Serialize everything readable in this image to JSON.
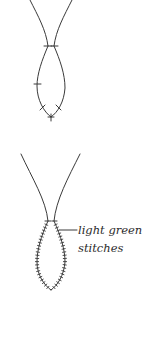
{
  "diagram": {
    "figures": [
      {
        "id": "figure-basic-loop",
        "description": "Two strands joining into a loop with sparse cross stitches"
      },
      {
        "id": "figure-stitched-loop",
        "description": "Two strands joining into a loop fully covered with cross stitches",
        "annotation": {
          "line1": "light green",
          "line2": "stitches"
        }
      }
    ],
    "colors": {
      "stroke": "#3a3a3a",
      "text": "#2b2b2b",
      "background": "#ffffff"
    }
  }
}
